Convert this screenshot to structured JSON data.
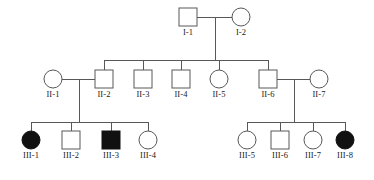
{
  "chart_data": {
    "type": "diagram",
    "subtype": "pedigree",
    "colors": {
      "line": "#58585a",
      "affected_fill": "#111111",
      "unaffected_fill": "#ffffff",
      "symbol_stroke": "#58585a",
      "label_text": "#1a1a1a",
      "background": "#ffffff"
    },
    "symbol_legend": {
      "square": "male",
      "circle": "female",
      "filled": "affected",
      "open": "unaffected"
    },
    "geometry": {
      "square_size": 18,
      "circle_radius": 9,
      "generation_symbol_y": [
        8,
        70,
        131
      ],
      "generation_label_y": [
        36,
        98,
        159
      ]
    },
    "generations": [
      {
        "name": "I",
        "individuals": [
          {
            "id": "I-1",
            "sex": "male",
            "shape": "square",
            "affected": false,
            "cx": 188,
            "cy": 17
          },
          {
            "id": "I-2",
            "sex": "female",
            "shape": "circle",
            "affected": false,
            "cx": 241,
            "cy": 17
          }
        ]
      },
      {
        "name": "II",
        "individuals": [
          {
            "id": "II-1",
            "sex": "female",
            "shape": "circle",
            "affected": false,
            "cx": 53,
            "cy": 79
          },
          {
            "id": "II-2",
            "sex": "male",
            "shape": "square",
            "affected": false,
            "cx": 104,
            "cy": 79
          },
          {
            "id": "II-3",
            "sex": "male",
            "shape": "square",
            "affected": false,
            "cx": 143,
            "cy": 79
          },
          {
            "id": "II-4",
            "sex": "male",
            "shape": "square",
            "affected": false,
            "cx": 181,
            "cy": 79
          },
          {
            "id": "II-5",
            "sex": "female",
            "shape": "circle",
            "affected": false,
            "cx": 219,
            "cy": 79
          },
          {
            "id": "II-6",
            "sex": "male",
            "shape": "square",
            "affected": false,
            "cx": 268,
            "cy": 79
          },
          {
            "id": "II-7",
            "sex": "female",
            "shape": "circle",
            "affected": false,
            "cx": 319,
            "cy": 79
          }
        ]
      },
      {
        "name": "III",
        "individuals": [
          {
            "id": "III-1",
            "sex": "female",
            "shape": "circle",
            "affected": true,
            "cx": 31,
            "cy": 140
          },
          {
            "id": "III-2",
            "sex": "male",
            "shape": "square",
            "affected": false,
            "cx": 71,
            "cy": 140
          },
          {
            "id": "III-3",
            "sex": "male",
            "shape": "square",
            "affected": true,
            "cx": 111,
            "cy": 140
          },
          {
            "id": "III-4",
            "sex": "female",
            "shape": "circle",
            "affected": false,
            "cx": 148,
            "cy": 140
          },
          {
            "id": "III-5",
            "sex": "female",
            "shape": "circle",
            "affected": false,
            "cx": 247,
            "cy": 140
          },
          {
            "id": "III-6",
            "sex": "male",
            "shape": "square",
            "affected": false,
            "cx": 280,
            "cy": 140
          },
          {
            "id": "III-7",
            "sex": "female",
            "shape": "circle",
            "affected": false,
            "cx": 313,
            "cy": 140
          },
          {
            "id": "III-8",
            "sex": "female",
            "shape": "circle",
            "affected": true,
            "cx": 345,
            "cy": 140
          }
        ]
      }
    ],
    "matings": [
      {
        "id": "mating-I",
        "partners": [
          "I-1",
          "I-2"
        ],
        "mating_y": 17,
        "x1": 197,
        "x2": 232,
        "descent_x": 215,
        "descent_y2": 60
      },
      {
        "id": "mating-II-1-II-2",
        "partners": [
          "II-1",
          "II-2"
        ],
        "mating_y": 79,
        "x1": 62,
        "x2": 95,
        "descent_x": 79,
        "descent_y2": 122
      },
      {
        "id": "mating-II-6-II-7",
        "partners": [
          "II-6",
          "II-7"
        ],
        "mating_y": 79,
        "x1": 277,
        "x2": 310,
        "descent_x": 294,
        "descent_y2": 122
      }
    ],
    "sibships": [
      {
        "id": "sibship-generation-II",
        "parents": [
          "I-1",
          "I-2"
        ],
        "sib_line_y": 60,
        "x_start": 104,
        "x_end": 268,
        "children": [
          "II-2",
          "II-3",
          "II-4",
          "II-5",
          "II-6"
        ],
        "child_drop_x": [
          104,
          143,
          181,
          219,
          268
        ],
        "child_drop_y2": 70
      },
      {
        "id": "sibship-generation-III-left",
        "parents": [
          "II-1",
          "II-2"
        ],
        "sib_line_y": 122,
        "x_start": 31,
        "x_end": 148,
        "children": [
          "III-1",
          "III-2",
          "III-3",
          "III-4"
        ],
        "child_drop_x": [
          31,
          71,
          111,
          148
        ],
        "child_drop_y2": 131
      },
      {
        "id": "sibship-generation-III-right",
        "parents": [
          "II-6",
          "II-7"
        ],
        "sib_line_y": 122,
        "x_start": 247,
        "x_end": 345,
        "children": [
          "III-5",
          "III-6",
          "III-7",
          "III-8"
        ],
        "child_drop_x": [
          247,
          280,
          313,
          345
        ],
        "child_drop_y2": 131
      }
    ],
    "labels": [
      "I-1",
      "I-2",
      "II-1",
      "II-2",
      "II-3",
      "II-4",
      "II-5",
      "II-6",
      "II-7",
      "III-1",
      "III-2",
      "III-3",
      "III-4",
      "III-5",
      "III-6",
      "III-7",
      "III-8"
    ]
  }
}
